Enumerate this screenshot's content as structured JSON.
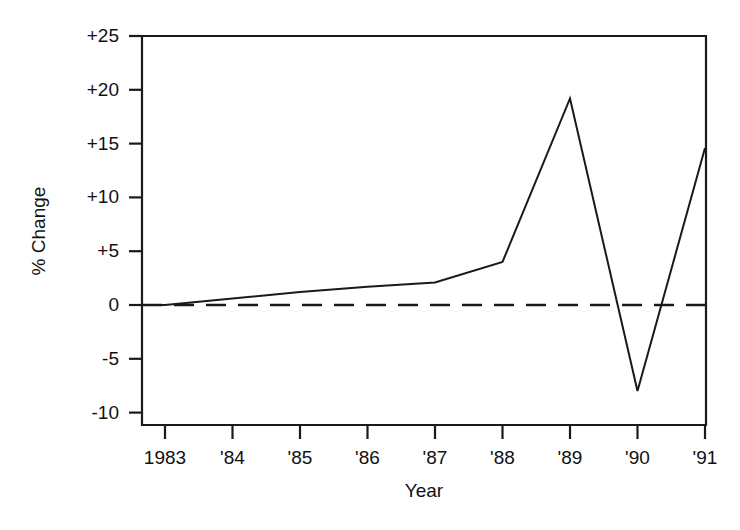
{
  "chart_data": {
    "type": "line",
    "title": "",
    "xlabel": "Year",
    "ylabel": "% Change",
    "x": [
      1983,
      1984,
      1985,
      1986,
      1987,
      1988,
      1989,
      1990,
      1991
    ],
    "xtick_labels": [
      "1983",
      "'84",
      "'85",
      "'86",
      "'87",
      "'88",
      "'89",
      "'90",
      "'91"
    ],
    "ytick_labels": [
      "+25",
      "+20",
      "+15",
      "+10",
      "+5",
      "0",
      "-5",
      "-10"
    ],
    "ytick_values": [
      25,
      20,
      15,
      10,
      5,
      0,
      -5,
      -10
    ],
    "values": [
      0.0,
      0.6,
      1.2,
      1.7,
      2.1,
      4.0,
      19.2,
      -8.0,
      14.6
    ],
    "series": [
      {
        "name": "% Change",
        "values": [
          0.0,
          0.6,
          1.2,
          1.7,
          2.1,
          4.0,
          19.2,
          -8.0,
          14.6
        ]
      }
    ],
    "reference_lines": [
      {
        "name": "zero-line",
        "value": 0,
        "style": "dashed"
      }
    ],
    "xlim": [
      1982.5,
      1991.0
    ],
    "ylim": [
      -12.5,
      26.8
    ],
    "grid": false,
    "legend": false,
    "line_color": "#1a1a1a",
    "background_color": "#ffffff"
  },
  "axes": {
    "y_title": "% Change",
    "x_title": "Year"
  }
}
